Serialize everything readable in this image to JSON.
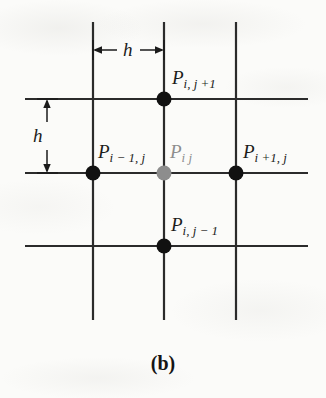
{
  "figure": {
    "caption": "(b)",
    "background_color": "#fbfbf9",
    "line_color": "#2b2b2b",
    "node_color": "#111111",
    "center_node_color": "#8d8d8d"
  },
  "dimensions": [
    {
      "name": "horizontal-spacing",
      "label": "h",
      "orientation": "horizontal",
      "from_px": 93,
      "to_px": 164,
      "axis_px": 50
    },
    {
      "name": "vertical-spacing",
      "label": "h",
      "orientation": "vertical",
      "from_px": 99,
      "to_px": 173,
      "axis_px": 47
    }
  ],
  "grid": {
    "vertical_lines_x": [
      93,
      164,
      236
    ],
    "horizontal_lines_y": [
      99,
      173,
      246
    ],
    "vertical_extent_y": [
      22,
      320
    ],
    "horizontal_extent_x": [
      25,
      308
    ]
  },
  "nodes": [
    {
      "id": "p-i-j-plus-1",
      "base": "P",
      "subscript": "i, j +1",
      "color": "#1b1b1b",
      "dot_x": 164,
      "dot_y": 99,
      "label_x": 172,
      "label_y": 68
    },
    {
      "id": "p-i-minus-1-j",
      "base": "P",
      "subscript": "i − 1, j",
      "color": "#1b1b1b",
      "dot_x": 93,
      "dot_y": 173,
      "label_x": 98,
      "label_y": 142
    },
    {
      "id": "p-i-j",
      "base": "P",
      "subscript": "i j",
      "color": "#8d8d8d",
      "dot_x": 164,
      "dot_y": 173,
      "label_x": 170,
      "label_y": 142
    },
    {
      "id": "p-i-plus-1-j",
      "base": "P",
      "subscript": "i +1, j",
      "color": "#1b1b1b",
      "dot_x": 236,
      "dot_y": 173,
      "label_x": 243,
      "label_y": 142
    },
    {
      "id": "p-i-j-minus-1",
      "base": "P",
      "subscript": "i, j − 1",
      "color": "#1b1b1b",
      "dot_x": 164,
      "dot_y": 246,
      "label_x": 171,
      "label_y": 215
    }
  ]
}
